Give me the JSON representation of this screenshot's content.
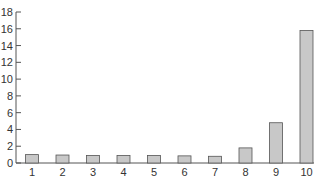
{
  "chart_data": {
    "type": "bar",
    "title": "",
    "xlabel": "",
    "ylabel": "",
    "categories": [
      "1",
      "2",
      "3",
      "4",
      "5",
      "6",
      "7",
      "8",
      "9",
      "10"
    ],
    "values": [
      1.0,
      0.95,
      0.9,
      0.9,
      0.9,
      0.85,
      0.8,
      1.8,
      4.8,
      15.8
    ],
    "ylim": [
      0,
      18
    ],
    "yticks": [
      0,
      2,
      4,
      6,
      8,
      10,
      12,
      14,
      16,
      18
    ],
    "grid": false,
    "legend": null,
    "colors": {
      "bar_fill": "#c8c8c8",
      "bar_stroke": "#555555",
      "axis": "#555555",
      "text": "#333333"
    }
  }
}
